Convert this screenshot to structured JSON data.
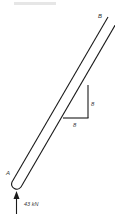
{
  "figure": {
    "labels": {
      "end_top": "B",
      "end_bottom": "A",
      "slope_vertical": "8",
      "slope_horizontal": "8",
      "force": "43 kN"
    },
    "colors": {
      "stroke": "#1a1a1a",
      "background": "#ffffff"
    }
  }
}
